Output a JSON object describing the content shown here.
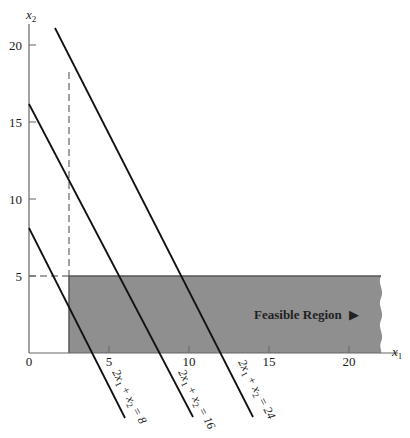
{
  "figure": {
    "type": "linear-programming-feasible-region",
    "x_axis": {
      "label": "x",
      "label_sub": "1",
      "ticks": [
        "0",
        "5",
        "10",
        "15",
        "20"
      ],
      "range": [
        0,
        22
      ]
    },
    "y_axis": {
      "label": "x",
      "label_sub": "2",
      "ticks": [
        "5",
        "10",
        "15",
        "20"
      ],
      "range": [
        0,
        21
      ]
    },
    "constraint_lines": [
      {
        "equation": "2x₁ + x₂ = 8",
        "label_parts": [
          "2x",
          "1",
          " + x",
          "2",
          " = 8"
        ]
      },
      {
        "equation": "2x₁ + x₂ = 16",
        "label_parts": [
          "2x",
          "1",
          " + x",
          "2",
          " = 16"
        ]
      },
      {
        "equation": "2x₁ + x₂ = 24",
        "label_parts": [
          "2x",
          "1",
          " + x",
          "2",
          " = 24"
        ]
      }
    ],
    "guide_lines": {
      "vertical_dashed_x": 2.5,
      "horizontal_dashed_y": 5
    },
    "feasible_region": {
      "label": "Feasible Region",
      "arrow": "▶",
      "x_min": 2.5,
      "y_max": 5,
      "fill_color": "#8f8f8f",
      "edge_color": "#555555"
    }
  }
}
